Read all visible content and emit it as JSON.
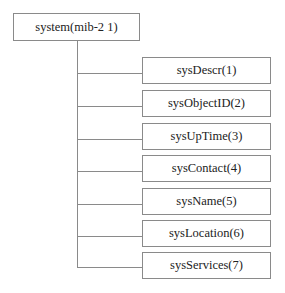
{
  "diagram": {
    "type": "tree",
    "root": {
      "label": "system(mib-2 1)"
    },
    "children": [
      {
        "label": "sysDescr(1)"
      },
      {
        "label": "sysObjectID(2)"
      },
      {
        "label": "sysUpTime(3)"
      },
      {
        "label": "sysContact(4)"
      },
      {
        "label": "sysName(5)"
      },
      {
        "label": "sysLocation(6)"
      },
      {
        "label": "sysServices(7)"
      }
    ]
  }
}
